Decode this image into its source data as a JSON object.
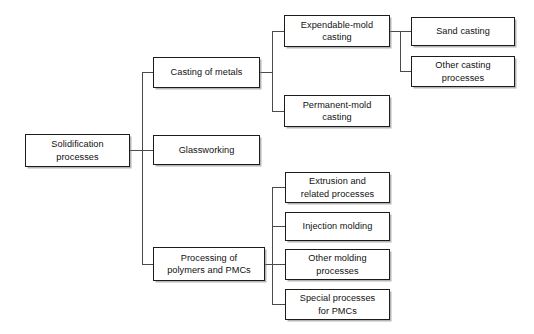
{
  "diagram": {
    "type": "tree-diagram",
    "orientation": "left-to-right",
    "style": {
      "box_border_color": "#1c1c1c",
      "box_fill_color": "#ffffff",
      "connector_color": "#4a4a4a",
      "text_color": "#111111",
      "background_color": "#ffffff"
    },
    "nodes": {
      "root": {
        "id": "solidification-processes",
        "label": "Solidification\nprocesses",
        "line1": "Solidification",
        "line2": "processes",
        "level": 0
      },
      "level1": [
        {
          "id": "casting-of-metals",
          "label": "Casting of metals",
          "line1": "Casting of metals",
          "line2": "",
          "level": 1
        },
        {
          "id": "glassworking",
          "label": "Glassworking",
          "line1": "Glassworking",
          "line2": "",
          "level": 1
        },
        {
          "id": "processing-of-polymers-and-pmcs",
          "label": "Processing of\npolymers and PMCs",
          "line1": "Processing of",
          "line2": "polymers and PMCs",
          "level": 1
        }
      ],
      "level2_casting": [
        {
          "id": "expendable-mold-casting",
          "label": "Expendable-mold\ncasting",
          "line1": "Expendable-mold",
          "line2": "casting",
          "level": 2
        },
        {
          "id": "permanent-mold-casting",
          "label": "Permanent-mold\ncasting",
          "line1": "Permanent-mold",
          "line2": "casting",
          "level": 2
        }
      ],
      "level3_expendable": [
        {
          "id": "sand-casting",
          "label": "Sand casting",
          "line1": "Sand casting",
          "line2": "",
          "level": 3
        },
        {
          "id": "other-casting-processes",
          "label": "Other casting\nprocesses",
          "line1": "Other casting",
          "line2": "processes",
          "level": 3
        }
      ],
      "level2_polymers": [
        {
          "id": "extrusion-and-related-processes",
          "label": "Extrusion and\nrelated processes",
          "line1": "Extrusion and",
          "line2": "related processes",
          "level": 2
        },
        {
          "id": "injection-molding",
          "label": "Injection molding",
          "line1": "Injection molding",
          "line2": "",
          "level": 2
        },
        {
          "id": "other-molding-processes",
          "label": "Other molding\nprocesses",
          "line1": "Other molding",
          "line2": "processes",
          "level": 2
        },
        {
          "id": "special-processes-for-pmcs",
          "label": "Special processes\nfor PMCs",
          "line1": "Special processes",
          "line2": "for PMCs",
          "level": 2
        }
      ]
    }
  }
}
